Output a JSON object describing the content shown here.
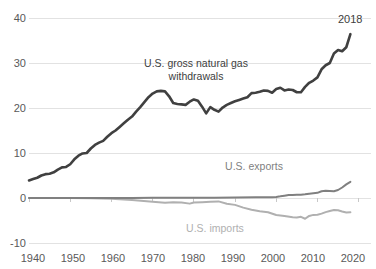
{
  "chart_data": {
    "type": "line",
    "title": "",
    "xlabel": "",
    "ylabel": "",
    "xlim": [
      1940,
      2023
    ],
    "ylim": [
      -10,
      40
    ],
    "xticks": [
      1940,
      1950,
      1960,
      1970,
      1980,
      1990,
      2000,
      2010,
      2020
    ],
    "yticks": [
      -10,
      0,
      10,
      20,
      30,
      40
    ],
    "grid": "horizontal",
    "legend_position": "inline-annotations",
    "annotations": [
      {
        "name": "withdrawals-label",
        "text": "U.S. gross natural gas withdrawals",
        "color": "#404040"
      },
      {
        "name": "exports-label",
        "text": "U.S. exports",
        "color": "#808080"
      },
      {
        "name": "imports-label",
        "text": "U.S. imports",
        "color": "#b0b0b0"
      },
      {
        "name": "end-year-label",
        "text": "2018",
        "color": "#404040"
      }
    ],
    "series": [
      {
        "name": "U.S. gross natural gas withdrawals",
        "color": "#404040",
        "x": [
          1940,
          1941,
          1942,
          1943,
          1944,
          1945,
          1946,
          1947,
          1948,
          1949,
          1950,
          1951,
          1952,
          1953,
          1954,
          1955,
          1956,
          1957,
          1958,
          1959,
          1960,
          1961,
          1962,
          1963,
          1964,
          1965,
          1966,
          1967,
          1968,
          1969,
          1970,
          1971,
          1972,
          1973,
          1974,
          1975,
          1976,
          1977,
          1978,
          1979,
          1980,
          1981,
          1982,
          1983,
          1984,
          1985,
          1986,
          1987,
          1988,
          1989,
          1990,
          1991,
          1992,
          1993,
          1994,
          1995,
          1996,
          1997,
          1998,
          1999,
          2000,
          2001,
          2002,
          2003,
          2004,
          2005,
          2006,
          2007,
          2008,
          2009,
          2010,
          2011,
          2012,
          2013,
          2014,
          2015,
          2016,
          2017,
          2018
        ],
        "y": [
          3.9,
          4.2,
          4.5,
          5.0,
          5.3,
          5.4,
          5.7,
          6.3,
          6.8,
          6.9,
          7.5,
          8.6,
          9.4,
          9.9,
          10.0,
          11.0,
          11.8,
          12.3,
          12.7,
          13.6,
          14.4,
          15.0,
          15.8,
          16.6,
          17.4,
          18.1,
          19.2,
          20.2,
          21.3,
          22.4,
          23.2,
          23.7,
          23.8,
          23.7,
          22.6,
          21.1,
          20.9,
          20.8,
          20.7,
          21.4,
          21.9,
          21.6,
          20.3,
          18.8,
          20.2,
          19.6,
          19.2,
          20.1,
          20.7,
          21.1,
          21.5,
          21.8,
          22.1,
          22.4,
          23.3,
          23.4,
          23.6,
          23.9,
          23.8,
          23.4,
          24.2,
          24.5,
          23.9,
          24.1,
          24.0,
          23.5,
          23.5,
          24.7,
          25.6,
          26.1,
          26.8,
          28.6,
          29.5,
          30.0,
          32.1,
          32.9,
          32.6,
          33.5,
          36.4
        ]
      },
      {
        "name": "U.S. exports",
        "color": "#808080",
        "x": [
          1940,
          1945,
          1950,
          1955,
          1960,
          1965,
          1970,
          1975,
          1980,
          1985,
          1990,
          1995,
          1997,
          1999,
          2000,
          2001,
          2002,
          2003,
          2004,
          2005,
          2006,
          2007,
          2008,
          2009,
          2010,
          2011,
          2012,
          2013,
          2014,
          2015,
          2016,
          2017,
          2018
        ],
        "y": [
          0.0,
          0.0,
          0.0,
          0.0,
          0.0,
          0.0,
          0.07,
          0.07,
          0.05,
          0.06,
          0.09,
          0.15,
          0.16,
          0.16,
          0.24,
          0.37,
          0.52,
          0.68,
          0.68,
          0.73,
          0.72,
          0.82,
          0.96,
          1.07,
          1.14,
          1.51,
          1.62,
          1.57,
          1.49,
          1.78,
          2.33,
          3.02,
          3.6
        ]
      },
      {
        "name": "U.S. imports",
        "color": "#b0b0b0",
        "x": [
          1940,
          1945,
          1950,
          1955,
          1960,
          1965,
          1970,
          1973,
          1975,
          1977,
          1979,
          1980,
          1982,
          1984,
          1986,
          1988,
          1990,
          1992,
          1994,
          1996,
          1998,
          2000,
          2002,
          2004,
          2005,
          2006,
          2007,
          2008,
          2009,
          2010,
          2011,
          2012,
          2013,
          2014,
          2015,
          2016,
          2017,
          2018
        ],
        "y": [
          0.0,
          0.0,
          -0.02,
          -0.04,
          -0.16,
          -0.46,
          -0.82,
          -1.03,
          -0.95,
          -1.01,
          -1.25,
          -0.99,
          -0.93,
          -0.84,
          -0.75,
          -1.29,
          -1.53,
          -2.14,
          -2.62,
          -2.94,
          -3.15,
          -3.78,
          -4.02,
          -4.26,
          -4.34,
          -4.19,
          -4.61,
          -3.98,
          -3.75,
          -3.74,
          -3.47,
          -3.14,
          -2.88,
          -2.68,
          -2.72,
          -3.0,
          -3.22,
          -3.16
        ]
      }
    ]
  },
  "axes": {
    "y_tick_labels": [
      "40",
      "30",
      "20",
      "10",
      "0",
      "-10"
    ],
    "x_tick_labels": [
      "1940",
      "1950",
      "1960",
      "1970",
      "1980",
      "1990",
      "2000",
      "2010",
      "2020"
    ]
  },
  "labels": {
    "withdrawals_line1": "U.S. gross natural gas",
    "withdrawals_line2": "withdrawals",
    "exports": "U.S. exports",
    "imports": "U.S. imports",
    "end_year": "2018"
  },
  "colors": {
    "withdrawals": "#404040",
    "exports": "#808080",
    "imports": "#b0b0b0",
    "gridline": "#e2e2e2",
    "text": "#595959"
  }
}
